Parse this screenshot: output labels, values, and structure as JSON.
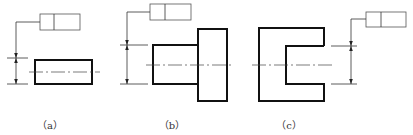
{
  "figure": {
    "panels": [
      {
        "id": "a",
        "label": "（a）",
        "description": "Rectangular part with symmetric tolerance frame"
      },
      {
        "id": "b",
        "label": "（b）",
        "description": "Stepped shaft part with tolerance frame on smaller feature"
      },
      {
        "id": "c",
        "label": "（c）",
        "description": "U-shaped slot part with tolerance frame on slot width"
      }
    ],
    "feature_control_frames": [
      {
        "panel": "a",
        "cells": [
          "",
          ""
        ]
      },
      {
        "panel": "b",
        "cells": [
          "",
          ""
        ]
      },
      {
        "panel": "c",
        "cells": [
          "",
          ""
        ]
      }
    ],
    "colors": {
      "line": "#111111",
      "thin_line": "#333333",
      "background": "#ffffff"
    }
  }
}
